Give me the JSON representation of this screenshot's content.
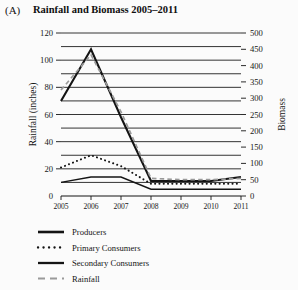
{
  "panel": {
    "label": "(A)"
  },
  "title": "Rainfall and Biomass 2005–2011",
  "axes": {
    "left_title": "Rainfall (inches)",
    "right_title": "Biomass",
    "left_ticks": [
      "0",
      "20",
      "40",
      "60",
      "80",
      "100",
      "120"
    ],
    "right_ticks": [
      "0",
      "50",
      "100",
      "150",
      "200",
      "250",
      "300",
      "350",
      "400",
      "450",
      "500"
    ],
    "x_ticks": [
      "2005",
      "2006",
      "2007",
      "2008",
      "2009",
      "2010",
      "2011"
    ]
  },
  "legend": {
    "items": [
      {
        "label": "Producers",
        "style": "solid-thick",
        "color": "#141414"
      },
      {
        "label": "Primary Consumers",
        "style": "dotted",
        "color": "#141414"
      },
      {
        "label": "Secondary Consumers",
        "style": "solid",
        "color": "#141414"
      },
      {
        "label": "Rainfall",
        "style": "dashed",
        "color": "#9a9a9a"
      }
    ]
  },
  "chart_data": {
    "type": "line",
    "title": "Rainfall and Biomass 2005–2011",
    "xlabel": "",
    "ylabel": "Rainfall (inches)",
    "y2label": "Biomass",
    "categories": [
      "2005",
      "2006",
      "2007",
      "2008",
      "2009",
      "2010",
      "2011"
    ],
    "ylim": [
      0,
      120
    ],
    "y2lim": [
      0,
      500
    ],
    "ytick_step": 20,
    "y2tick_step": 50,
    "gridline_step": 10,
    "grid": true,
    "legend_position": "below-left",
    "series": [
      {
        "name": "Producers",
        "axis": "right",
        "style": "solid-thick",
        "color": "#141414",
        "values_left_scale": [
          70,
          108,
          58,
          11,
          11,
          11,
          14
        ],
        "values": [
          292,
          450,
          242,
          46,
          46,
          46,
          58
        ]
      },
      {
        "name": "Primary Consumers",
        "axis": "right",
        "style": "dotted",
        "color": "#141414",
        "values_left_scale": [
          21,
          30,
          22,
          9,
          9,
          9,
          9
        ],
        "values": [
          88,
          125,
          92,
          38,
          38,
          38,
          38
        ]
      },
      {
        "name": "Secondary Consumers",
        "axis": "right",
        "style": "solid",
        "color": "#141414",
        "values_left_scale": [
          10,
          14,
          14,
          5,
          5,
          5,
          5
        ],
        "values": [
          42,
          58,
          58,
          21,
          21,
          21,
          21
        ]
      },
      {
        "name": "Rainfall",
        "axis": "left",
        "style": "dashed",
        "color": "#9a9a9a",
        "values_left_scale": [
          78,
          104,
          62,
          13,
          12,
          12,
          13
        ],
        "values": [
          78,
          104,
          62,
          13,
          12,
          12,
          13
        ]
      }
    ]
  }
}
